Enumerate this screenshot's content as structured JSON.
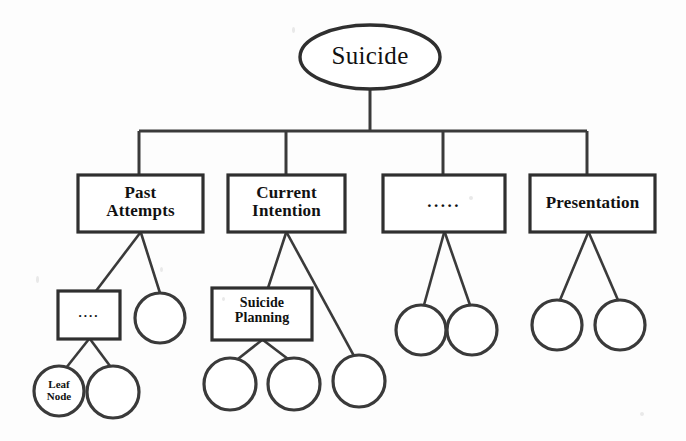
{
  "diagram": {
    "type": "tree",
    "colors": {
      "background": "#fdfdfd",
      "stroke": "#3a3a3a",
      "text": "#111111",
      "fill": "#ffffff"
    },
    "root": {
      "id": "root",
      "label": "Suicide",
      "shape": "ellipse",
      "cx": 370,
      "cy": 57,
      "rx": 70,
      "ry": 32
    },
    "level2": [
      {
        "id": "past-attempts",
        "label": "Past\nAttempts",
        "shape": "rect",
        "x": 78,
        "y": 175,
        "w": 125,
        "h": 57
      },
      {
        "id": "current-intention",
        "label": "Current\nIntention",
        "shape": "rect",
        "x": 228,
        "y": 175,
        "w": 117,
        "h": 57
      },
      {
        "id": "ellipsis-category",
        "label": ".....",
        "shape": "rect",
        "x": 383,
        "y": 175,
        "w": 122,
        "h": 57
      },
      {
        "id": "presentation",
        "label": "Presentation",
        "shape": "rect",
        "x": 530,
        "y": 175,
        "w": 125,
        "h": 57
      }
    ],
    "level3": [
      {
        "id": "past-ellipsis-box",
        "label": "....",
        "shape": "rect",
        "parent": "past-attempts",
        "x": 58,
        "y": 291,
        "w": 62,
        "h": 48
      },
      {
        "id": "past-circle-a",
        "label": "",
        "shape": "circle",
        "parent": "past-attempts",
        "cx": 160,
        "cy": 318,
        "r": 25
      },
      {
        "id": "suicide-planning",
        "label": "Suicide\nPlanning",
        "shape": "rect",
        "parent": "current-intention",
        "x": 212,
        "y": 288,
        "w": 100,
        "h": 52
      },
      {
        "id": "current-circle-a",
        "label": "",
        "shape": "circle",
        "parent": "current-intention",
        "cx": 359,
        "cy": 381,
        "r": 26
      },
      {
        "id": "ellipsis-circle-a",
        "label": "",
        "shape": "circle",
        "parent": "ellipsis-category",
        "cx": 421,
        "cy": 330,
        "r": 25
      },
      {
        "id": "ellipsis-circle-b",
        "label": "",
        "shape": "circle",
        "parent": "ellipsis-category",
        "cx": 472,
        "cy": 330,
        "r": 25
      },
      {
        "id": "presentation-circle-a",
        "label": "",
        "shape": "circle",
        "parent": "presentation",
        "cx": 557,
        "cy": 325,
        "r": 25
      },
      {
        "id": "presentation-circle-b",
        "label": "",
        "shape": "circle",
        "parent": "presentation",
        "cx": 620,
        "cy": 325,
        "r": 25
      }
    ],
    "level4": [
      {
        "id": "leaf-node",
        "label": "Leaf\nNode",
        "shape": "circle",
        "parent": "past-ellipsis-box",
        "cx": 59,
        "cy": 391,
        "r": 25
      },
      {
        "id": "past-leaf-circle",
        "label": "",
        "shape": "circle",
        "parent": "past-ellipsis-box",
        "cx": 113,
        "cy": 392,
        "r": 26
      },
      {
        "id": "planning-circle-a",
        "label": "",
        "shape": "circle",
        "parent": "suicide-planning",
        "cx": 230,
        "cy": 384,
        "r": 26
      },
      {
        "id": "planning-circle-b",
        "label": "",
        "shape": "circle",
        "parent": "suicide-planning",
        "cx": 294,
        "cy": 384,
        "r": 26
      }
    ],
    "labels": {
      "root_label": "Suicide",
      "past_attempts_label": "Past\nAttempts",
      "current_intention_label": "Current\nIntention",
      "ellipsis_category_label": ".....",
      "presentation_label": "Presentation",
      "past_ellipsis_box_label": "....",
      "suicide_planning_label": "Suicide\nPlanning",
      "leaf_node_label": "Leaf\nNode"
    }
  }
}
